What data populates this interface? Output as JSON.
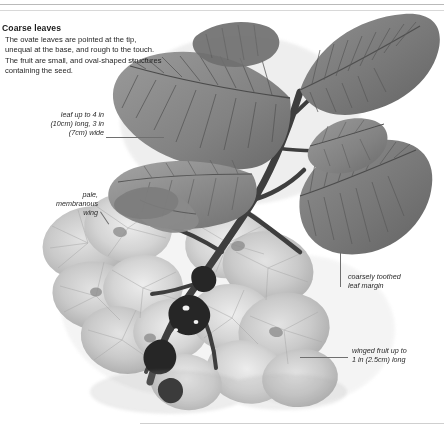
{
  "page": {
    "caption": {
      "title": "Coarse leaves",
      "body": "The ovate leaves are pointed at the tip, unequal at the base, and rough to the touch. The fruit are small, and oval-shaped structures containing the seed."
    },
    "annotations": [
      {
        "id": "leaf-size",
        "text": "leaf up to 4 in\n(10cm) long, 3 in\n(7cm) wide"
      },
      {
        "id": "wing",
        "text": "pale,\nmembranous\nwing"
      },
      {
        "id": "margin",
        "text": "coarsely toothed\nleaf margin"
      },
      {
        "id": "fruit",
        "text": "winged fruit up to\n1 in (2.5cm) long"
      }
    ],
    "illustration": {
      "subject": "elm-branch-with-leaves-and-winged-fruit",
      "rendering": "grayscale-photograph",
      "colors": {
        "leaf_dark": "#6e6e6e",
        "leaf_mid": "#8c8c8c",
        "leaf_light": "#a8a8a8",
        "stem_dark": "#3a3a3a",
        "fruit_pale": "#cfcfcf",
        "fruit_shadow": "#b0b0b0",
        "background": "#ffffff"
      }
    }
  }
}
